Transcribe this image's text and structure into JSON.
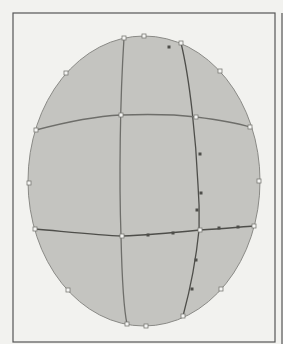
{
  "diagram": {
    "kind": "gradient-mesh-ellipse",
    "colors": {
      "paper": "#f2f2ef",
      "frame": "#555555",
      "ellipse_fill": "#c4c4c0",
      "ellipse_stroke": "#8a8a86",
      "mesh_line": "#6e6e6a",
      "mesh_line_dark": "#4e4e4a",
      "anchor_fill": "#f4f4f2",
      "anchor_stroke": "#7a7a76"
    },
    "frame": {
      "x": 13,
      "y": 13,
      "width": 262,
      "height": 329
    },
    "second_frame_edge_x": 282,
    "ellipse": {
      "cx": 144,
      "cy": 181,
      "rx": 116,
      "ry": 145
    },
    "mesh_lines": [
      {
        "name": "vertical-left",
        "d": "M 124 38 C 120 100, 119 180, 121 236 C 122 280, 124 310, 127 324"
      },
      {
        "name": "vertical-right",
        "d": "M 181 43 C 190 80, 196 140, 198 185 C 200 210, 199 225, 199 230 C 196 260, 190 290, 183 316"
      },
      {
        "name": "horizontal-upper",
        "d": "M 36 130 C 70 121, 100 116, 121 115 C 150 114, 180 115, 196 117 C 220 120, 240 124, 250 127"
      },
      {
        "name": "horizontal-lower",
        "d": "M 35 229 C 70 232, 100 235, 122 236 C 150 235, 180 232, 200 230 C 220 229, 240 227, 254 226"
      }
    ],
    "anchors_edge": [
      [
        124,
        38
      ],
      [
        144,
        36
      ],
      [
        181,
        43
      ],
      [
        220,
        71
      ],
      [
        250,
        127
      ],
      [
        259,
        181
      ],
      [
        254,
        226
      ],
      [
        221,
        289
      ],
      [
        183,
        316
      ],
      [
        146,
        326
      ],
      [
        127,
        324
      ],
      [
        68,
        290
      ],
      [
        35,
        229
      ],
      [
        29,
        183
      ],
      [
        36,
        130
      ],
      [
        66,
        73
      ]
    ],
    "anchors_inner": [
      [
        121,
        115
      ],
      [
        196,
        117
      ],
      [
        122,
        236
      ],
      [
        200,
        230
      ]
    ],
    "handles": [
      [
        200,
        154
      ],
      [
        201,
        193
      ],
      [
        148,
        235
      ],
      [
        173,
        233
      ],
      [
        219,
        228
      ],
      [
        238,
        227
      ],
      [
        196,
        260
      ],
      [
        192,
        289
      ],
      [
        197,
        210
      ],
      [
        169,
        47
      ]
    ]
  }
}
